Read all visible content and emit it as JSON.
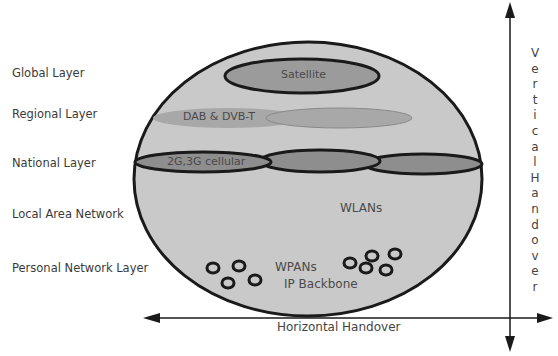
{
  "layers": [
    {
      "label": "Global Layer",
      "y": 66
    },
    {
      "label": "Regional Layer",
      "y": 107
    },
    {
      "label": "National Layer",
      "y": 156
    },
    {
      "label": "Local Area Network",
      "y": 207
    },
    {
      "label": "Personal Network Layer",
      "y": 261
    }
  ],
  "technologies": {
    "satellite": "Satellite",
    "broadcast": "DAB & DVB-T",
    "cellular": "2G,3G cellular",
    "wlan": "WLANs",
    "wpan": "WPANs",
    "backbone": "IP Backbone"
  },
  "axes": {
    "vertical": "Vertical Handover",
    "vertical_letters": [
      "V",
      "e",
      "r",
      "t",
      "i",
      "c",
      "a",
      "l",
      "H",
      "a",
      "n",
      "d",
      "o",
      "v",
      "e",
      "r"
    ],
    "horizontal": "Horizontal Handover"
  },
  "colors": {
    "sphere_fill": "#c9c9c9",
    "satellite_fill": "#9b9b9b",
    "broadcast_fill": "#a8a8a8",
    "cellular_fill": "#8e8e8e",
    "stroke": "#1a1a1a"
  }
}
